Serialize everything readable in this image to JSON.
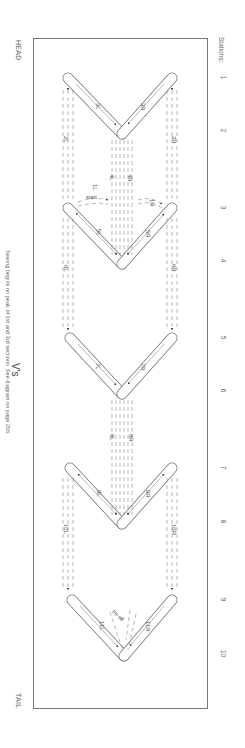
{
  "diagram": {
    "title": "V's",
    "caption": "Sewing begins on peak of 1st and 3rd sections. See diagram on page 206.",
    "ends": {
      "head": "HEAD",
      "tail": "TAIL"
    },
    "stations_label": "Stations:",
    "stations": [
      {
        "num": "1",
        "y": 78
      },
      {
        "num": "2",
        "y": 131
      },
      {
        "num": "3",
        "y": 208
      },
      {
        "num": "4",
        "y": 261
      },
      {
        "num": "5",
        "y": 338
      },
      {
        "num": "6",
        "y": 391
      },
      {
        "num": "7",
        "y": 468
      },
      {
        "num": "8",
        "y": 522
      },
      {
        "num": "9",
        "y": 600
      },
      {
        "num": "10",
        "y": 654
      }
    ],
    "annotations": {
      "start": "start",
      "tie_off": "tie-off"
    },
    "step_labels": [
      "1L",
      "1R",
      "2L",
      "2R",
      "3L",
      "3R",
      "4L",
      "4R",
      "5L",
      "5R",
      "6L",
      "6R",
      "7L",
      "7R",
      "8L",
      "8R",
      "9L",
      "9R",
      "10L",
      "10R",
      "11L",
      "11R"
    ],
    "colors": {
      "line": "#777777",
      "text": "#555555",
      "frame": "#777777",
      "background": "#ffffff"
    }
  }
}
